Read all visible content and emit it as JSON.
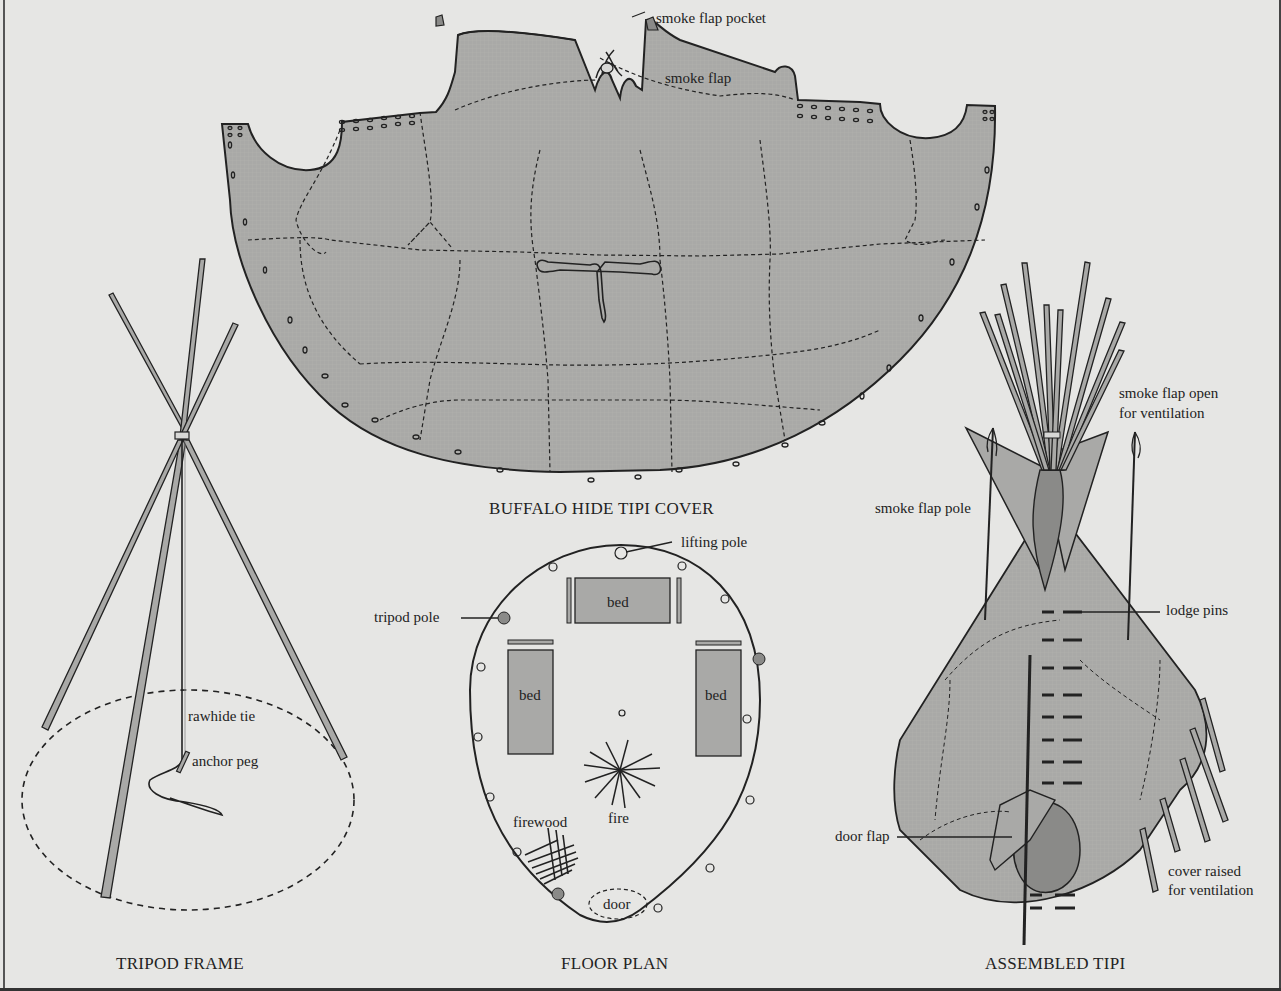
{
  "figure": {
    "colors": {
      "background": "#e6e6e4",
      "hide_fill": "#a9a9a7",
      "dark_fill": "#8a8a88",
      "outline": "#222222"
    },
    "panels": [
      {
        "id": "buffalo-hide-tipi-cover",
        "title": "BUFFALO HIDE TIPI COVER",
        "labels": [
          "smoke flap pocket",
          "smoke flap"
        ]
      },
      {
        "id": "tripod-frame",
        "title": "TRIPOD FRAME",
        "labels": [
          "rawhide tie",
          "anchor peg"
        ]
      },
      {
        "id": "floor-plan",
        "title": "FLOOR PLAN",
        "labels": [
          "lifting pole",
          "tripod pole",
          "bed",
          "bed",
          "bed",
          "fire",
          "firewood",
          "door"
        ]
      },
      {
        "id": "assembled-tipi",
        "title": "ASSEMBLED TIPI",
        "labels": [
          "smoke flap open",
          "for ventilation",
          "smoke flap pole",
          "lodge pins",
          "door flap",
          "cover raised",
          "for ventilation"
        ]
      }
    ]
  },
  "cover": {
    "title": "BUFFALO HIDE TIPI COVER",
    "smoke_flap_pocket": "smoke flap pocket",
    "smoke_flap": "smoke flap"
  },
  "tripod": {
    "title": "TRIPOD FRAME",
    "rawhide_tie": "rawhide tie",
    "anchor_peg": "anchor peg"
  },
  "floor": {
    "title": "FLOOR PLAN",
    "lifting_pole": "lifting pole",
    "tripod_pole": "tripod pole",
    "bed_top": "bed",
    "bed_left": "bed",
    "bed_right": "bed",
    "fire": "fire",
    "firewood": "firewood",
    "door": "door"
  },
  "assembled": {
    "title": "ASSEMBLED TIPI",
    "smoke_flap_open_1": "smoke flap open",
    "smoke_flap_open_2": "for ventilation",
    "smoke_flap_pole": "smoke flap pole",
    "lodge_pins": "lodge pins",
    "door_flap": "door flap",
    "cover_raised_1": "cover raised",
    "cover_raised_2": "for ventilation"
  }
}
